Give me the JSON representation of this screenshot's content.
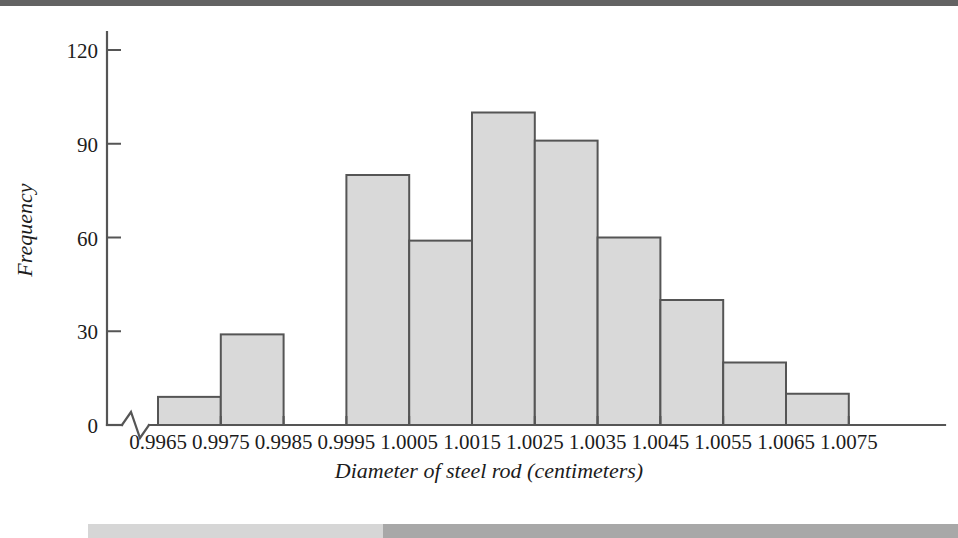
{
  "page": {
    "background_color": "#ffffff",
    "scan_artifacts": {
      "top_strip_color": "#636363",
      "bottom_strip_light_color": "#d6d6d6",
      "bottom_strip_dark_color": "#a8a8a8"
    }
  },
  "chart_data": {
    "type": "bar",
    "title": "",
    "subtitle": "",
    "xlabel": "Diameter of steel rod (centimeters)",
    "ylabel": "Frequency",
    "categories": [
      "0.9965",
      "0.9975",
      "0.9985",
      "0.9995",
      "1.0005",
      "1.0015",
      "1.0025",
      "1.0035",
      "1.0045",
      "1.0055",
      "1.0065",
      "1.0075"
    ],
    "values": [
      9,
      29,
      0,
      80,
      59,
      100,
      91,
      60,
      40,
      20,
      10,
      0
    ],
    "bins": [
      {
        "label": "0.9965",
        "left_tick": "0.9965",
        "right_tick": "0.9975",
        "frequency": 9
      },
      {
        "label": "0.9975",
        "left_tick": "0.9975",
        "right_tick": "0.9985",
        "frequency": 29
      },
      {
        "label": "0.9985",
        "left_tick": "0.9985",
        "right_tick": "0.9995",
        "frequency": 0
      },
      {
        "label": "0.9995",
        "left_tick": "0.9995",
        "right_tick": "1.0005",
        "frequency": 80
      },
      {
        "label": "1.0005",
        "left_tick": "1.0005",
        "right_tick": "1.0015",
        "frequency": 59
      },
      {
        "label": "1.0015",
        "left_tick": "1.0015",
        "right_tick": "1.0025",
        "frequency": 100
      },
      {
        "label": "1.0025",
        "left_tick": "1.0025",
        "right_tick": "1.0035",
        "frequency": 91
      },
      {
        "label": "1.0035",
        "left_tick": "1.0035",
        "right_tick": "1.0045",
        "frequency": 60
      },
      {
        "label": "1.0045",
        "left_tick": "1.0045",
        "right_tick": "1.0055",
        "frequency": 40
      },
      {
        "label": "1.0055",
        "left_tick": "1.0055",
        "right_tick": "1.0065",
        "frequency": 20
      },
      {
        "label": "1.0065",
        "left_tick": "1.0065",
        "right_tick": "1.0075",
        "frequency": 10
      }
    ],
    "yticks": [
      0,
      30,
      60,
      90,
      120
    ],
    "ytick_labels": [
      "0",
      "30",
      "60",
      "90",
      "120"
    ],
    "ylim": [
      0,
      128
    ],
    "xlim_ticks": 12,
    "grid": false,
    "legend": null,
    "axis_break": {
      "present": true,
      "axis": "x",
      "description": "zigzag break symbol on x-axis just right of the origin"
    },
    "style": {
      "bar_fill": "#d9d9d9",
      "bar_stroke": "#555555",
      "axis_color": "#555555",
      "text_color": "#1c1c1c"
    }
  }
}
